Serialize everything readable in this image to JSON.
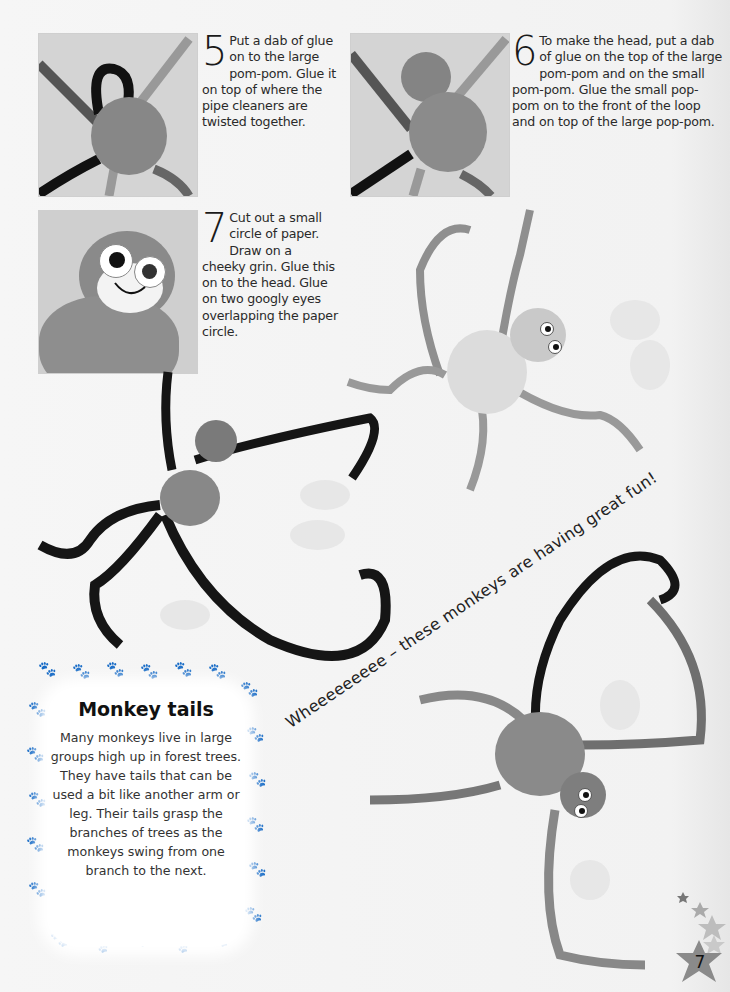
{
  "page": {
    "number": "7",
    "background": "#f4f4f4"
  },
  "steps": [
    {
      "number": "5",
      "text": "Put a dab of glue on to the large pom-pom. Glue it on top of where the pipe cleaners are twisted together.",
      "photo": "pom-pom-on-twisted-pipe-cleaners"
    },
    {
      "number": "6",
      "text": "To make the head, put a dab of glue on the top of the large pom-pom and on the small pom-pom. Glue the small pop-pom on to the front of the loop and on top of the large pop-pom.",
      "photo": "small-pom-pom-head-attached"
    },
    {
      "number": "7",
      "text": "Cut out a small circle of paper. Draw on a cheeky grin. Glue this on to the head. Glue on two googly eyes overlapping the paper circle.",
      "photo": "monkey-face-close-up"
    }
  ],
  "slogan": "Wheeeeeeeee – these monkeys are having great fun!",
  "info_box": {
    "title": "Monkey tails",
    "body": "Many monkeys live in large groups high up in forest trees. They have tails that can be used a bit like another arm or leg. Their tails grasp the branches of trees as the monkeys swing from one branch to the next.",
    "border_icon": "paw-print-icon"
  },
  "decorations": {
    "stars": [
      "star-icon",
      "star-icon",
      "star-icon",
      "star-icon"
    ],
    "accent_gray": "#8c8c8c"
  }
}
